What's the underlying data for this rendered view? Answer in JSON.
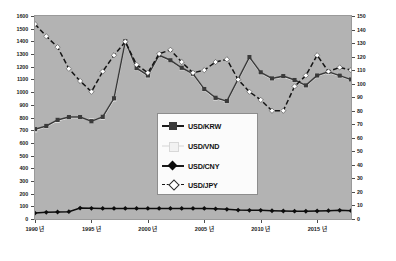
{
  "chart_data": {
    "type": "line",
    "title": "",
    "subtitle": "",
    "xlabel": "",
    "ylabel": "",
    "ylabel_right": "",
    "grid": false,
    "legend_position": "center",
    "x": [
      1990,
      1991,
      1992,
      1993,
      1994,
      1995,
      1996,
      1997,
      1998,
      1999,
      2000,
      2001,
      2002,
      2003,
      2004,
      2005,
      2006,
      2007,
      2008,
      2009,
      2010,
      2011,
      2012,
      2013,
      2014,
      2015,
      2016,
      2017,
      2018
    ],
    "xtick_labels": [
      "1990 년",
      "1995 년",
      "2000 년",
      "2005 년",
      "2010 년",
      "2015 년"
    ],
    "xtick_values": [
      1990,
      1995,
      2000,
      2005,
      2010,
      2015
    ],
    "xlim": [
      1990,
      2018
    ],
    "ylim": [
      0,
      1600
    ],
    "ytick_labels": [
      "0",
      "100",
      "200",
      "300",
      "400",
      "500",
      "600",
      "700",
      "800",
      "900",
      "1000",
      "1100",
      "1200",
      "1300",
      "1400",
      "1500",
      "1600"
    ],
    "ylim_right": [
      0,
      150
    ],
    "ytick_labels_right": [
      "0",
      "10",
      "20",
      "30",
      "40",
      "50",
      "60",
      "70",
      "80",
      "90",
      "100",
      "110",
      "120",
      "130",
      "140",
      "150"
    ],
    "series": [
      {
        "name": "USD/KRW",
        "axis": "left",
        "marker": "square",
        "color": "#3a3a3a",
        "line_style": "solid",
        "values": [
          708,
          733,
          781,
          803,
          803,
          771,
          805,
          951,
          1401,
          1189,
          1131,
          1291,
          1251,
          1192,
          1145,
          1024,
          955,
          929,
          1102,
          1276,
          1156,
          1108,
          1126,
          1095,
          1053,
          1131,
          1160,
          1130,
          1100
        ]
      },
      {
        "name": "USD/VND",
        "axis": "left",
        "marker": "square",
        "color": "#f2f2f2",
        "line_style": "solid",
        "values": [
          700,
          730,
          775,
          800,
          800,
          775,
          800,
          945,
          1395,
          1185,
          1128,
          1288,
          1248,
          1190,
          1142,
          1020,
          952,
          925,
          1098,
          1272,
          1152,
          1105,
          1122,
          1092,
          1050,
          1128,
          1157,
          1128,
          1098
        ]
      },
      {
        "name": "USD/CNY",
        "axis": "left",
        "marker": "diamond",
        "color": "#0d0d0d",
        "line_style": "solid",
        "values": [
          47,
          53,
          55,
          58,
          86,
          84,
          83,
          83,
          83,
          83,
          83,
          83,
          83,
          83,
          83,
          83,
          80,
          76,
          70,
          68,
          68,
          65,
          63,
          62,
          61,
          63,
          66,
          68,
          66
        ]
      },
      {
        "name": "USD/JPY",
        "axis": "right",
        "marker": "diamond",
        "color": "#141414",
        "line_style": "dashed",
        "values": [
          144,
          135,
          127,
          111,
          102,
          94,
          109,
          121,
          131,
          114,
          108,
          122,
          125,
          116,
          108,
          110,
          116,
          118,
          103,
          94,
          88,
          80,
          80,
          98,
          106,
          121,
          109,
          112,
          110
        ]
      }
    ]
  },
  "legend": {
    "items": [
      {
        "label": "USD/KRW"
      },
      {
        "label": "USD/VND"
      },
      {
        "label": "USD/CNY"
      },
      {
        "label": "USD/JPY"
      }
    ]
  },
  "colors": {
    "plot_background": "#b3b3b3",
    "page_background": "#ffffff",
    "axis_text": "#1b1b1b",
    "legend_background": "#fbfbfb"
  }
}
